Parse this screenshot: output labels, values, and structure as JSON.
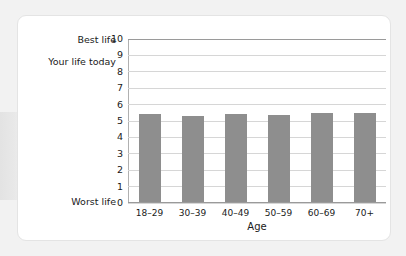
{
  "chart_data": {
    "type": "bar",
    "title": "",
    "categories": [
      "18–29",
      "30–39",
      "40–49",
      "50–59",
      "60–69",
      "70+"
    ],
    "values": [
      5.35,
      5.25,
      5.35,
      5.3,
      5.45,
      5.4
    ],
    "xlabel": "Age",
    "ylabel": "Your life today",
    "ylim": [
      0,
      10
    ],
    "yticks": [
      "0",
      "1",
      "2",
      "3",
      "4",
      "5",
      "6",
      "7",
      "8",
      "9",
      "10"
    ],
    "y_axis_endpoint_labels": {
      "max": "Best life",
      "min": "Worst life"
    },
    "grid": true,
    "legend": false,
    "bar_color": "#8e8e8e",
    "gridline_color": "#d6d6d6",
    "axis_color": "#9a9a9a"
  },
  "card": {
    "background": "#ffffff",
    "page_background": "#f2f2f2"
  }
}
